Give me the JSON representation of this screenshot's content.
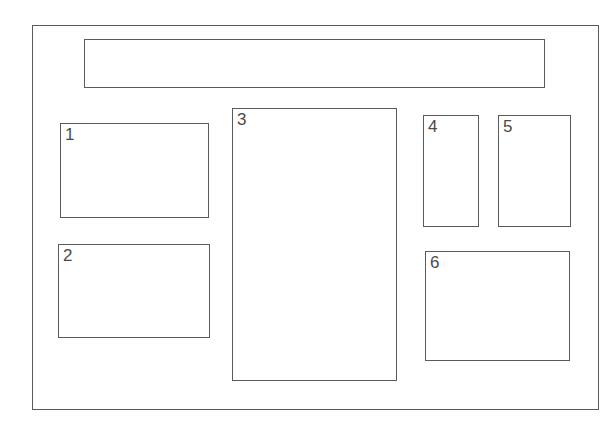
{
  "diagram": {
    "outer_frame": {
      "x": 32,
      "y": 25,
      "w": 567,
      "h": 385
    },
    "header_bar": {
      "x": 84,
      "y": 39,
      "w": 461,
      "h": 49,
      "label": ""
    },
    "regions": [
      {
        "label": "1",
        "x": 60,
        "y": 123,
        "w": 149,
        "h": 95
      },
      {
        "label": "2",
        "x": 58,
        "y": 244,
        "w": 152,
        "h": 94
      },
      {
        "label": "3",
        "x": 232,
        "y": 108,
        "w": 165,
        "h": 273
      },
      {
        "label": "4",
        "x": 423,
        "y": 115,
        "w": 56,
        "h": 112
      },
      {
        "label": "5",
        "x": 498,
        "y": 115,
        "w": 73,
        "h": 112
      },
      {
        "label": "6",
        "x": 425,
        "y": 251,
        "w": 145,
        "h": 110
      }
    ],
    "colors": {
      "stroke": "#5a5a5a",
      "text": "#4a4a4a",
      "background": "#ffffff"
    }
  }
}
